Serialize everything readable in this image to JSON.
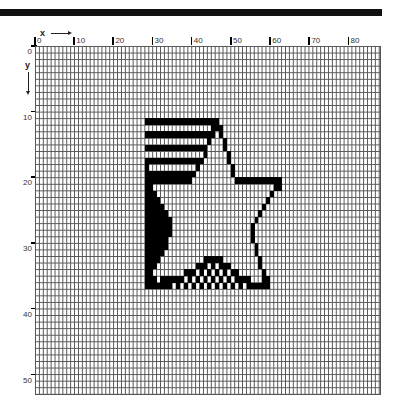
{
  "axes": {
    "x_label": "x",
    "y_label": "y",
    "x_ticks": [
      "0",
      "10",
      "20",
      "30",
      "40",
      "50",
      "60",
      "70",
      "80"
    ],
    "y_ticks": [
      "0",
      "10",
      "20",
      "30",
      "40",
      "50"
    ]
  },
  "grid": {
    "cols": 88,
    "rows": 53
  },
  "pixels": {
    "11": [
      [
        28,
        46
      ]
    ],
    "12": [
      [
        45,
        47
      ]
    ],
    "13": [
      [
        28,
        44
      ],
      [
        45,
        45
      ],
      [
        47,
        47
      ]
    ],
    "14": [
      [
        44,
        44
      ],
      [
        48,
        48
      ]
    ],
    "15": [
      [
        28,
        43
      ],
      [
        48,
        48
      ]
    ],
    "16": [
      [
        43,
        43
      ],
      [
        49,
        49
      ]
    ],
    "17": [
      [
        28,
        42
      ],
      [
        49,
        49
      ]
    ],
    "18": [
      [
        28,
        28
      ],
      [
        41,
        41
      ],
      [
        50,
        50
      ]
    ],
    "19": [
      [
        28,
        40
      ],
      [
        50,
        50
      ]
    ],
    "20": [
      [
        28,
        39
      ],
      [
        51,
        62
      ]
    ],
    "21": [
      [
        28,
        29
      ],
      [
        61,
        62
      ]
    ],
    "22": [
      [
        28,
        30
      ],
      [
        60,
        60
      ]
    ],
    "23": [
      [
        28,
        31
      ],
      [
        59,
        59
      ]
    ],
    "24": [
      [
        28,
        32
      ],
      [
        58,
        58
      ]
    ],
    "25": [
      [
        28,
        33
      ],
      [
        57,
        57
      ]
    ],
    "26": [
      [
        28,
        34
      ],
      [
        56,
        56
      ]
    ],
    "27": [
      [
        28,
        34
      ],
      [
        55,
        55
      ]
    ],
    "28": [
      [
        28,
        34
      ],
      [
        55,
        55
      ]
    ],
    "29": [
      [
        28,
        33
      ],
      [
        55,
        55
      ]
    ],
    "30": [
      [
        28,
        33
      ],
      [
        56,
        56
      ]
    ],
    "31": [
      [
        28,
        32
      ],
      [
        56,
        56
      ]
    ],
    "32": [
      [
        28,
        31
      ],
      [
        43,
        47
      ],
      [
        57,
        57
      ]
    ],
    "33": [
      [
        28,
        30
      ],
      [
        41,
        43
      ],
      [
        45,
        45
      ],
      [
        47,
        49
      ],
      [
        57,
        57
      ]
    ],
    "34": [
      [
        28,
        29
      ],
      [
        38,
        40
      ],
      [
        42,
        42
      ],
      [
        44,
        44
      ],
      [
        46,
        46
      ],
      [
        48,
        48
      ],
      [
        50,
        51
      ],
      [
        58,
        58
      ]
    ],
    "35": [
      [
        28,
        30
      ],
      [
        32,
        37
      ],
      [
        39,
        39
      ],
      [
        41,
        41
      ],
      [
        43,
        43
      ],
      [
        45,
        45
      ],
      [
        47,
        47
      ],
      [
        49,
        49
      ],
      [
        51,
        54
      ],
      [
        58,
        59
      ]
    ],
    "36": [
      [
        28,
        34
      ],
      [
        36,
        36
      ],
      [
        38,
        38
      ],
      [
        40,
        40
      ],
      [
        42,
        42
      ],
      [
        44,
        44
      ],
      [
        46,
        46
      ],
      [
        48,
        48
      ],
      [
        50,
        50
      ],
      [
        52,
        52
      ],
      [
        54,
        59
      ]
    ]
  }
}
